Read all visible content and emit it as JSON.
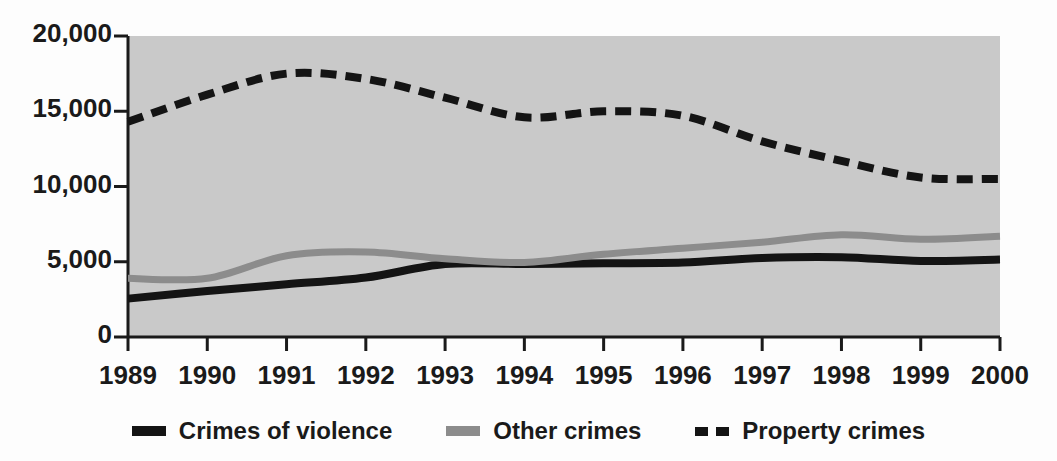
{
  "chart_data": {
    "type": "line",
    "title": "",
    "subtitle": "",
    "xlabel": "",
    "ylabel": "",
    "categories": [
      "1989",
      "1990",
      "1991",
      "1992",
      "1993",
      "1994",
      "1995",
      "1996",
      "1997",
      "1998",
      "1999",
      "2000"
    ],
    "x": [
      1989,
      1990,
      1991,
      1992,
      1993,
      1994,
      1995,
      1996,
      1997,
      1998,
      1999,
      2000
    ],
    "xlim": [
      1989,
      2000
    ],
    "ylim": [
      0,
      20000
    ],
    "yticks": [
      0,
      5000,
      10000,
      15000,
      20000
    ],
    "ytick_labels": [
      "0",
      "5,000",
      "10,000",
      "15,000",
      "20,000"
    ],
    "grid": false,
    "legend_position": "bottom",
    "plot_background": "#c9c9c9",
    "series": [
      {
        "name": "Crimes of violence",
        "color": "#141414",
        "style": "solid",
        "values": [
          2550,
          3050,
          3500,
          3950,
          4850,
          4850,
          4900,
          4950,
          5250,
          5300,
          5050,
          5150
        ]
      },
      {
        "name": "Other crimes",
        "color": "#8c8c8c",
        "style": "solid",
        "values": [
          3900,
          3900,
          5400,
          5650,
          5200,
          4950,
          5500,
          5900,
          6300,
          6800,
          6500,
          6700
        ]
      },
      {
        "name": "Property crimes",
        "color": "#141414",
        "style": "dashed",
        "values": [
          14300,
          16100,
          17500,
          17150,
          15900,
          14600,
          15000,
          14700,
          13000,
          11700,
          10600,
          10500
        ]
      }
    ]
  },
  "axes": {
    "ytick_labels": [
      "20,000",
      "15,000",
      "10,000",
      "5,000",
      "0"
    ],
    "xtick_labels": [
      "1989",
      "1990",
      "1991",
      "1992",
      "1993",
      "1994",
      "1995",
      "1996",
      "1997",
      "1998",
      "1999",
      "2000"
    ]
  },
  "legend": {
    "items": [
      {
        "label": "Crimes of violence",
        "swatch": "solid-dark-line-icon"
      },
      {
        "label": "Other crimes",
        "swatch": "solid-gray-line-icon"
      },
      {
        "label": "Property crimes",
        "swatch": "dashed-dark-line-icon"
      }
    ]
  }
}
